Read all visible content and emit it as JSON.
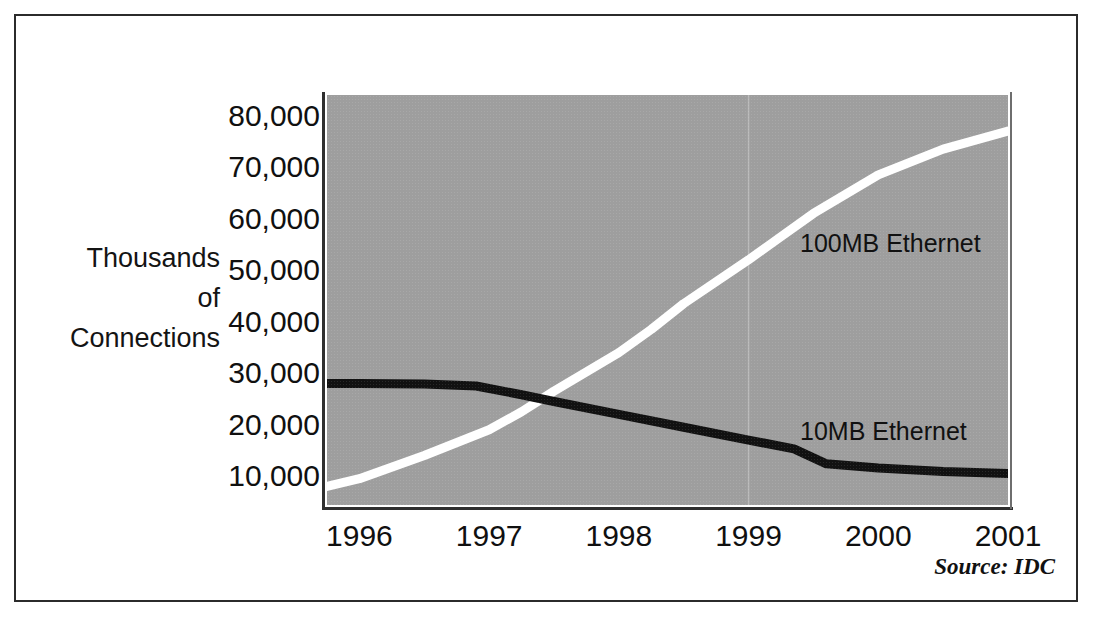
{
  "figure": {
    "source_note": "Source:  IDC",
    "axis_caption_lines": [
      "Thousands",
      "of",
      "Connections"
    ],
    "plot_background_color": "#9e9e9e",
    "frame_color": "#2b2b2b"
  },
  "chart_data": {
    "type": "line",
    "title": "",
    "subtitle": "",
    "xlabel": "",
    "ylabel": "Thousands of Connections",
    "xlim": [
      1995.75,
      2001.0
    ],
    "ylim": [
      4400,
      84000
    ],
    "grid": false,
    "legend_position": "inline-annotations",
    "y_ticks": [
      80000,
      70000,
      60000,
      50000,
      40000,
      30000,
      20000,
      10000
    ],
    "y_tick_labels": [
      "80,000",
      "70,000",
      "60,000",
      "50,000",
      "40,000",
      "30,000",
      "20,000",
      "10,000"
    ],
    "x_ticks": [
      1996,
      1997,
      1998,
      1999,
      2000,
      2001
    ],
    "x_tick_labels": [
      "1996",
      "1997",
      "1998",
      "1999",
      "2000",
      "2001"
    ],
    "annotations": [
      {
        "text": "100MB Ethernet",
        "x": 1999.4,
        "y": 57000
      },
      {
        "text": "10MB Ethernet",
        "x": 1999.4,
        "y": 18500
      }
    ],
    "series": [
      {
        "name": "100MB Ethernet",
        "color": "#ffffff",
        "x": [
          1995.75,
          1996.0,
          1996.5,
          1997.0,
          1997.25,
          1997.5,
          1998.0,
          1998.25,
          1998.5,
          1999.0,
          1999.25,
          1999.5,
          2000.0,
          2000.5,
          2001.0
        ],
        "values": [
          8000,
          9500,
          14000,
          19000,
          22500,
          26500,
          34000,
          38500,
          43500,
          52000,
          56500,
          61000,
          68500,
          73500,
          77000
        ]
      },
      {
        "name": "10MB Ethernet",
        "color": "#111111",
        "x": [
          1995.75,
          1996.0,
          1996.5,
          1996.9,
          1997.25,
          1997.5,
          1998.0,
          1998.5,
          1999.0,
          1999.35,
          1999.6,
          2000.0,
          2000.5,
          2001.0
        ],
        "values": [
          28000,
          28000,
          27900,
          27500,
          25800,
          24500,
          22000,
          19500,
          17000,
          15300,
          12400,
          11600,
          10900,
          10500
        ]
      }
    ]
  }
}
